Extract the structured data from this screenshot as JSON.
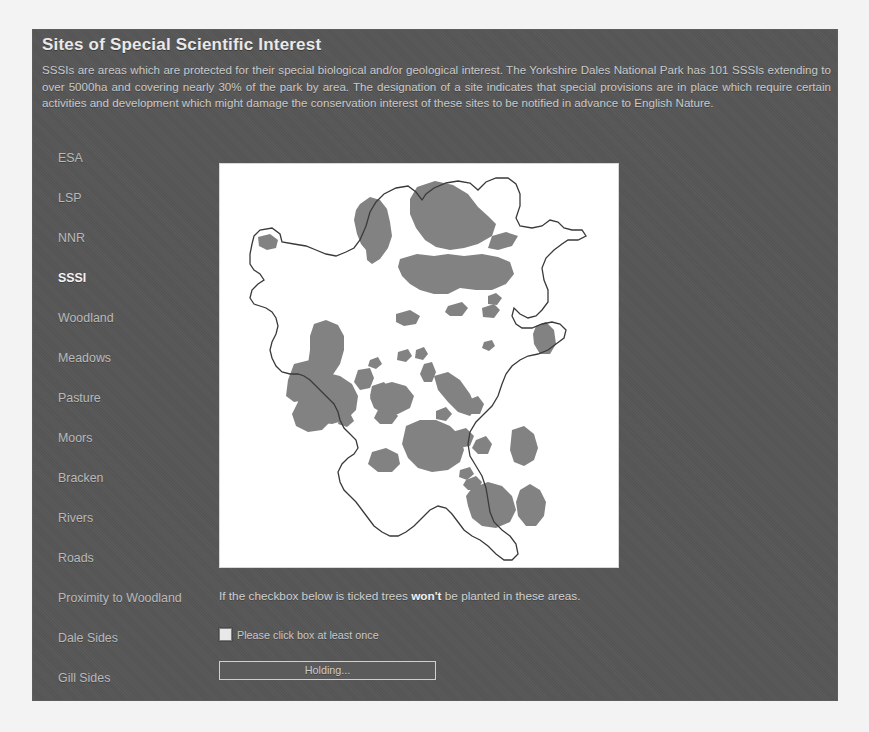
{
  "app": {
    "title": "Sites of Special Scientific Interest",
    "intro": "SSSIs are areas which are protected for their special biological and/or geological interest. The Yorkshire Dales National Park has 101 SSSIs extending to over 5000ha and covering nearly 30% of the park by area. The designation of a site indicates that special provisions are in place which require certain activities and development which might damage the conservation interest of these sites to be notified in advance to English Nature.",
    "panel_bg": "#565656",
    "text_color": "#c9c9c9",
    "active_color": "#f2f2f2"
  },
  "sidebar": {
    "items": [
      {
        "label": "ESA",
        "active": false
      },
      {
        "label": "LSP",
        "active": false
      },
      {
        "label": "NNR",
        "active": false
      },
      {
        "label": "SSSI",
        "active": true
      },
      {
        "label": "Woodland",
        "active": false
      },
      {
        "label": "Meadows",
        "active": false
      },
      {
        "label": "Pasture",
        "active": false
      },
      {
        "label": "Moors",
        "active": false
      },
      {
        "label": "Bracken",
        "active": false
      },
      {
        "label": "Rivers",
        "active": false
      },
      {
        "label": "Roads",
        "active": false
      },
      {
        "label": "Proximity to Woodland",
        "active": false
      },
      {
        "label": "Dale Sides",
        "active": false
      },
      {
        "label": "Gill Sides",
        "active": false
      }
    ]
  },
  "map": {
    "background": "#ffffff",
    "outline_color": "#3a3a3a",
    "region_fill": "#808080",
    "alt_text": "Map of the Yorkshire Dales National Park with shaded SSSI areas"
  },
  "controls": {
    "note_before": "If the checkbox below is ticked trees ",
    "note_bold": "won't",
    "note_after": " be planted in these areas.",
    "checkbox_label": "Please click box at least once",
    "checkbox_checked": false,
    "status_button_label": "Holding..."
  }
}
